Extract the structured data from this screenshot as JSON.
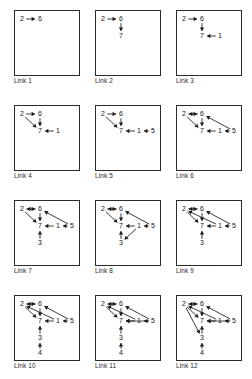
{
  "figure": {
    "node_ids": [
      "1",
      "2",
      "3",
      "4",
      "5",
      "6",
      "7"
    ],
    "stroke_color": "#1a1a1a",
    "background_color": "#ffffff",
    "grid": {
      "rows": 4,
      "cols": 3
    }
  },
  "node_positions": {
    "2": {
      "x": 8,
      "y": 9
    },
    "6": {
      "x": 26,
      "y": 9
    },
    "7": {
      "x": 26,
      "y": 26
    },
    "1": {
      "x": 44,
      "y": 26
    },
    "5": {
      "x": 58,
      "y": 26
    },
    "3": {
      "x": 26,
      "y": 43
    },
    "4": {
      "x": 26,
      "y": 58
    }
  },
  "panels": [
    {
      "id": "link-1",
      "caption": "Link 1",
      "nodes": [
        "2",
        "6"
      ],
      "edges": [
        {
          "from": "2",
          "to": "6",
          "label": "2-to-6"
        }
      ]
    },
    {
      "id": "link-2",
      "caption": "Link 2",
      "nodes": [
        "2",
        "6",
        "7"
      ],
      "edges": [
        {
          "from": "2",
          "to": "6",
          "label": "2-to-6"
        },
        {
          "from": "6",
          "to": "7",
          "label": "6-to-7"
        }
      ]
    },
    {
      "id": "link-3",
      "caption": "Link 3",
      "nodes": [
        "2",
        "6",
        "7",
        "1"
      ],
      "edges": [
        {
          "from": "2",
          "to": "6",
          "label": "2-to-6"
        },
        {
          "from": "6",
          "to": "7",
          "label": "6-to-7"
        },
        {
          "from": "1",
          "to": "7",
          "label": "1-to-7"
        }
      ]
    },
    {
      "id": "link-4",
      "caption": "Link 4",
      "nodes": [
        "2",
        "6",
        "7",
        "1"
      ],
      "edges": [
        {
          "from": "2",
          "to": "6",
          "label": "2-to-6"
        },
        {
          "from": "6",
          "to": "7",
          "label": "6-to-7"
        },
        {
          "from": "1",
          "to": "7",
          "label": "1-to-7"
        },
        {
          "from": "2",
          "to": "7",
          "label": "2-to-7"
        }
      ]
    },
    {
      "id": "link-5",
      "caption": "Link 5",
      "nodes": [
        "2",
        "6",
        "7",
        "1",
        "5"
      ],
      "edges": [
        {
          "from": "2",
          "to": "6",
          "label": "2-to-6"
        },
        {
          "from": "6",
          "to": "7",
          "label": "6-to-7"
        },
        {
          "from": "1",
          "to": "7",
          "label": "1-to-7"
        },
        {
          "from": "2",
          "to": "7",
          "label": "2-to-7"
        },
        {
          "from": "5",
          "to": "1",
          "label": "5-to-1"
        }
      ]
    },
    {
      "id": "link-6",
      "caption": "Link 6",
      "nodes": [
        "2",
        "6",
        "7",
        "1",
        "5"
      ],
      "edges": [
        {
          "from": "2",
          "to": "6",
          "label": "2-to-6"
        },
        {
          "from": "6",
          "to": "2",
          "label": "6-to-2"
        },
        {
          "from": "6",
          "to": "7",
          "label": "6-to-7"
        },
        {
          "from": "1",
          "to": "7",
          "label": "1-to-7"
        },
        {
          "from": "2",
          "to": "7",
          "label": "2-to-7"
        },
        {
          "from": "5",
          "to": "1",
          "label": "5-to-1"
        },
        {
          "from": "5",
          "to": "6",
          "label": "5-to-6"
        }
      ]
    },
    {
      "id": "link-7",
      "caption": "Link 7",
      "nodes": [
        "2",
        "6",
        "7",
        "1",
        "5",
        "3"
      ],
      "edges": [
        {
          "from": "2",
          "to": "6",
          "label": "2-to-6"
        },
        {
          "from": "6",
          "to": "2",
          "label": "6-to-2"
        },
        {
          "from": "6",
          "to": "7",
          "label": "6-to-7"
        },
        {
          "from": "1",
          "to": "7",
          "label": "1-to-7"
        },
        {
          "from": "2",
          "to": "7",
          "label": "2-to-7"
        },
        {
          "from": "5",
          "to": "1",
          "label": "5-to-1"
        },
        {
          "from": "5",
          "to": "6",
          "label": "5-to-6"
        },
        {
          "from": "3",
          "to": "7",
          "label": "3-to-7"
        }
      ]
    },
    {
      "id": "link-8",
      "caption": "Link 8",
      "nodes": [
        "2",
        "6",
        "7",
        "1",
        "5",
        "3"
      ],
      "edges": [
        {
          "from": "2",
          "to": "6",
          "label": "2-to-6"
        },
        {
          "from": "6",
          "to": "2",
          "label": "6-to-2"
        },
        {
          "from": "6",
          "to": "7",
          "label": "6-to-7"
        },
        {
          "from": "1",
          "to": "7",
          "label": "1-to-7"
        },
        {
          "from": "2",
          "to": "7",
          "label": "2-to-7"
        },
        {
          "from": "5",
          "to": "1",
          "label": "5-to-1"
        },
        {
          "from": "5",
          "to": "6",
          "label": "5-to-6"
        },
        {
          "from": "3",
          "to": "7",
          "label": "3-to-7"
        },
        {
          "from": "1",
          "to": "3",
          "label": "1-to-3"
        }
      ]
    },
    {
      "id": "link-9",
      "caption": "Link 9",
      "nodes": [
        "2",
        "6",
        "7",
        "1",
        "5",
        "3"
      ],
      "edges": [
        {
          "from": "2",
          "to": "6",
          "label": "2-to-6"
        },
        {
          "from": "6",
          "to": "2",
          "label": "6-to-2"
        },
        {
          "from": "6",
          "to": "7",
          "label": "6-to-7"
        },
        {
          "from": "1",
          "to": "7",
          "label": "1-to-7"
        },
        {
          "from": "2",
          "to": "7",
          "label": "2-to-7"
        },
        {
          "from": "5",
          "to": "1",
          "label": "5-to-1"
        },
        {
          "from": "5",
          "to": "6",
          "label": "5-to-6"
        },
        {
          "from": "3",
          "to": "7",
          "label": "3-to-7"
        },
        {
          "from": "1",
          "to": "2",
          "label": "1-to-2"
        }
      ]
    },
    {
      "id": "link-10",
      "caption": "Link  10",
      "nodes": [
        "2",
        "6",
        "7",
        "1",
        "5",
        "3",
        "4"
      ],
      "edges": [
        {
          "from": "2",
          "to": "6",
          "label": "2-to-6"
        },
        {
          "from": "6",
          "to": "2",
          "label": "6-to-2"
        },
        {
          "from": "6",
          "to": "7",
          "label": "6-to-7"
        },
        {
          "from": "1",
          "to": "7",
          "label": "1-to-7"
        },
        {
          "from": "2",
          "to": "7",
          "label": "2-to-7"
        },
        {
          "from": "5",
          "to": "1",
          "label": "5-to-1"
        },
        {
          "from": "5",
          "to": "6",
          "label": "5-to-6"
        },
        {
          "from": "3",
          "to": "7",
          "label": "3-to-7"
        },
        {
          "from": "1",
          "to": "2",
          "label": "1-to-2"
        },
        {
          "from": "4",
          "to": "3",
          "label": "4-to-3"
        }
      ]
    },
    {
      "id": "link-11",
      "caption": "Link 11",
      "nodes": [
        "2",
        "6",
        "7",
        "1",
        "5",
        "3",
        "4"
      ],
      "edges": [
        {
          "from": "2",
          "to": "6",
          "label": "2-to-6"
        },
        {
          "from": "6",
          "to": "2",
          "label": "6-to-2"
        },
        {
          "from": "6",
          "to": "7",
          "label": "6-to-7"
        },
        {
          "from": "1",
          "to": "7",
          "label": "1-to-7"
        },
        {
          "from": "2",
          "to": "7",
          "label": "2-to-7"
        },
        {
          "from": "5",
          "to": "1",
          "label": "5-to-1"
        },
        {
          "from": "5",
          "to": "6",
          "label": "5-to-6"
        },
        {
          "from": "3",
          "to": "7",
          "label": "3-to-7"
        },
        {
          "from": "1",
          "to": "2",
          "label": "1-to-2"
        },
        {
          "from": "4",
          "to": "3",
          "label": "4-to-3"
        },
        {
          "from": "5",
          "to": "7",
          "label": "5-to-7"
        }
      ]
    },
    {
      "id": "link-12",
      "caption": "Link 12",
      "nodes": [
        "2",
        "6",
        "7",
        "1",
        "5",
        "3",
        "4"
      ],
      "edges": [
        {
          "from": "2",
          "to": "6",
          "label": "2-to-6"
        },
        {
          "from": "6",
          "to": "2",
          "label": "6-to-2"
        },
        {
          "from": "6",
          "to": "7",
          "label": "6-to-7"
        },
        {
          "from": "1",
          "to": "7",
          "label": "1-to-7"
        },
        {
          "from": "2",
          "to": "7",
          "label": "2-to-7"
        },
        {
          "from": "5",
          "to": "1",
          "label": "5-to-1"
        },
        {
          "from": "5",
          "to": "6",
          "label": "5-to-6"
        },
        {
          "from": "3",
          "to": "7",
          "label": "3-to-7"
        },
        {
          "from": "1",
          "to": "2",
          "label": "1-to-2"
        },
        {
          "from": "4",
          "to": "3",
          "label": "4-to-3"
        },
        {
          "from": "5",
          "to": "7",
          "label": "5-to-7"
        },
        {
          "from": "2",
          "to": "3",
          "label": "2-to-3"
        }
      ]
    }
  ]
}
